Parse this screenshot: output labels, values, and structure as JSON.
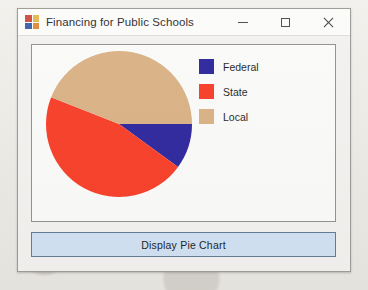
{
  "window": {
    "title": "Financing for Public Schools",
    "icon_name": "visual-studio-forms-icon",
    "controls": {
      "minimize_label": "Minimize",
      "maximize_label": "Maximize",
      "close_label": "Close"
    }
  },
  "main": {
    "button": {
      "label": "Display Pie Chart"
    }
  },
  "colors": {
    "federal": "#2a239c",
    "state": "#f73b24",
    "local": "#d9b183",
    "panel_background": "#fafaf8",
    "panel_border": "#8e8e8a",
    "button_fill": "#cfe0f2",
    "button_border": "#5f7896",
    "window_background": "#f2f1ef",
    "titlebar_background": "#fbfbfa"
  },
  "chart_data": {
    "type": "pie",
    "title": "",
    "categories": [
      "Federal",
      "State",
      "Local"
    ],
    "values": [
      10,
      46,
      44
    ],
    "unit": "percent",
    "legend_position": "right",
    "start_angle_deg": 0,
    "direction": "clockwise",
    "slices": [
      {
        "label": "Federal",
        "value": 10,
        "color": "#2a239c",
        "start_deg": 0,
        "end_deg": 36
      },
      {
        "label": "State",
        "value": 46,
        "color": "#f73b24",
        "start_deg": 36,
        "end_deg": 201.6
      },
      {
        "label": "Local",
        "value": 44,
        "color": "#d9b183",
        "start_deg": 201.6,
        "end_deg": 360
      }
    ]
  }
}
